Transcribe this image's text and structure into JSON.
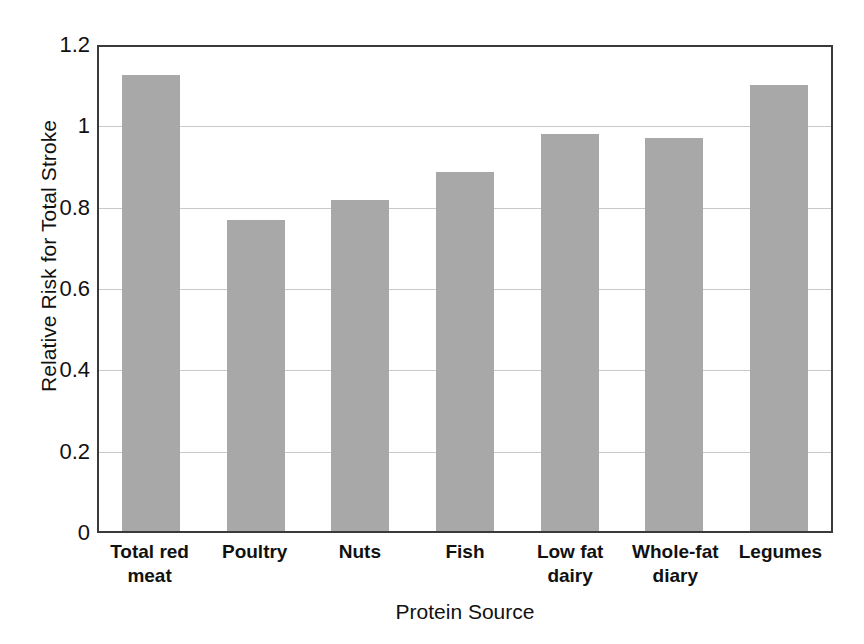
{
  "chart_data": {
    "type": "bar",
    "title": "",
    "xlabel": "Protein Source",
    "ylabel": "Relative Risk for Total Stroke",
    "categories": [
      "Total red meat",
      "Poultry",
      "Nuts",
      "Fish",
      "Low fat dairy",
      "Whole-fat diary",
      "Legumes"
    ],
    "category_lines": [
      [
        "Total red",
        "meat"
      ],
      [
        "Poultry",
        ""
      ],
      [
        "Nuts",
        ""
      ],
      [
        "Fish",
        ""
      ],
      [
        "Low fat",
        "dairy"
      ],
      [
        "Whole-fat",
        "diary"
      ],
      [
        "Legumes",
        ""
      ]
    ],
    "values": [
      1.13,
      0.77,
      0.82,
      0.89,
      0.985,
      0.975,
      1.105
    ],
    "ylim": [
      0,
      1.2
    ],
    "yticks": [
      0,
      0.2,
      0.4,
      0.6,
      0.8,
      1,
      1.2
    ],
    "ytick_labels": [
      "0",
      "0.2",
      "0.4",
      "0.6",
      "0.8",
      "1",
      "1.2"
    ],
    "grid": true,
    "grid_axis": "y",
    "legend": false,
    "bar_color": "#a8a8a8",
    "axis_color": "#3a3a3a",
    "gridline_color": "#c9c9c9",
    "background_color": "#ffffff"
  }
}
